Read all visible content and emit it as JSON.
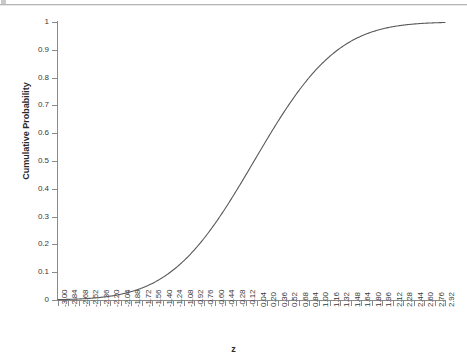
{
  "chart_data": {
    "type": "line",
    "title": "",
    "xlabel": "z",
    "ylabel": "Cumulative Probability",
    "xlim": [
      -3.0,
      2.92
    ],
    "ylim": [
      0,
      1
    ],
    "grid": false,
    "legend": "none",
    "line_color": "#595959",
    "background_color": "#ffffff",
    "axis_color": "#8a8a8a",
    "x_tick_labels": [
      "-3.00",
      "-2.84",
      "-2.68",
      "-2.52",
      "-2.36",
      "-2.20",
      "-2.04",
      "-1.88",
      "-1.72",
      "-1.56",
      "-1.40",
      "-1.24",
      "-1.08",
      "-0.92",
      "-0.76",
      "-0.60",
      "-0.44",
      "-0.28",
      "-0.12",
      "0.04",
      "0.20",
      "0.36",
      "0.52",
      "0.68",
      "0.84",
      "1.00",
      "1.16",
      "1.32",
      "1.48",
      "1.64",
      "1.80",
      "1.96",
      "2.12",
      "2.28",
      "2.44",
      "2.60",
      "2.76",
      "2.92"
    ],
    "y_tick_labels": [
      "0",
      "0.1",
      "0.2",
      "0.3",
      "0.4",
      "0.5",
      "0.6",
      "0.7",
      "0.8",
      "0.9",
      "1"
    ],
    "y_tick_values": [
      0,
      0.1,
      0.2,
      0.3,
      0.4,
      0.5,
      0.6,
      0.7,
      0.8,
      0.9,
      1
    ],
    "x": [
      -3.0,
      -2.84,
      -2.68,
      -2.52,
      -2.36,
      -2.2,
      -2.04,
      -1.88,
      -1.72,
      -1.56,
      -1.4,
      -1.24,
      -1.08,
      -0.92,
      -0.76,
      -0.6,
      -0.44,
      -0.28,
      -0.12,
      0.04,
      0.2,
      0.36,
      0.52,
      0.68,
      0.84,
      1.0,
      1.16,
      1.32,
      1.48,
      1.64,
      1.8,
      1.96,
      2.12,
      2.28,
      2.44,
      2.6,
      2.76,
      2.92
    ],
    "values": [
      0.0013,
      0.0023,
      0.0037,
      0.0059,
      0.0091,
      0.0139,
      0.0207,
      0.0301,
      0.0427,
      0.0594,
      0.0808,
      0.1075,
      0.1401,
      0.1788,
      0.2236,
      0.2743,
      0.33,
      0.3897,
      0.4522,
      0.516,
      0.5793,
      0.6406,
      0.6985,
      0.7517,
      0.7995,
      0.8413,
      0.877,
      0.9066,
      0.9306,
      0.9495,
      0.9641,
      0.975,
      0.983,
      0.9887,
      0.9927,
      0.9953,
      0.9971,
      0.9982
    ],
    "series": [
      {
        "name": "Cumulative Probability",
        "values": [
          0.0013,
          0.0023,
          0.0037,
          0.0059,
          0.0091,
          0.0139,
          0.0207,
          0.0301,
          0.0427,
          0.0594,
          0.0808,
          0.1075,
          0.1401,
          0.1788,
          0.2236,
          0.2743,
          0.33,
          0.3897,
          0.4522,
          0.516,
          0.5793,
          0.6406,
          0.6985,
          0.7517,
          0.7995,
          0.8413,
          0.877,
          0.9066,
          0.9306,
          0.9495,
          0.9641,
          0.975,
          0.983,
          0.9887,
          0.9927,
          0.9953,
          0.9971,
          0.9982
        ]
      }
    ]
  }
}
